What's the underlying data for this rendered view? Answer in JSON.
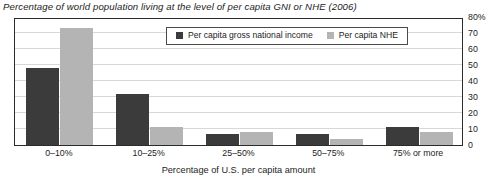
{
  "chart_data": {
    "type": "bar",
    "title": "Percentage of world population living at the level of per capita GNI or NHE (2006)",
    "xlabel": "Percentage of U.S. per capita amount",
    "ylabel": "",
    "categories": [
      "0–10%",
      "10–25%",
      "25–50%",
      "50–75%",
      "75% or more"
    ],
    "series": [
      {
        "name": "Per capita gross national income",
        "color": "#3b3b3b",
        "values": [
          48,
          32,
          7,
          7,
          11
        ]
      },
      {
        "name": "Per capita NHE",
        "color": "#b4b4b4",
        "values": [
          73,
          11,
          8,
          4,
          8
        ]
      }
    ],
    "ylim": [
      0,
      80
    ],
    "yticks": [
      "80%",
      "70",
      "60",
      "50",
      "40",
      "30",
      "20",
      "10",
      "0"
    ],
    "ytick_values": [
      80,
      70,
      60,
      50,
      40,
      30,
      20,
      10,
      0
    ],
    "grid": true,
    "legend_position": "top-center"
  }
}
